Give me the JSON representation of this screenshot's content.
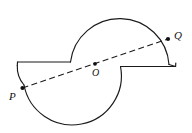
{
  "figure": {
    "type": "geometry-diagram",
    "canvas": {
      "width": 192,
      "height": 133
    },
    "stroke_color": "#1a1a1a",
    "background_color": "#ffffff",
    "points": [
      {
        "id": "P",
        "label": "P",
        "x": 22,
        "y": 88,
        "marker": "dot"
      },
      {
        "id": "O",
        "label": "O",
        "x": 95,
        "y": 64,
        "marker": "dot"
      },
      {
        "id": "Q",
        "label": "Q",
        "x": 168,
        "y": 39,
        "marker": "dot"
      }
    ],
    "segments": [
      {
        "id": "PQ",
        "name": "dashed-diagonal-PQ",
        "style": "dashed",
        "from": "P",
        "to": "Q",
        "passes_through": "O"
      }
    ],
    "paths": {
      "outline": "M 16 62 L 16 63 L 70 63 A 52 52 0 1 1 120 68 L 175 68 L 175 65 A 52 52 0 1 1 122 63 L 16 63",
      "outline_description": "Closed S-shaped outline: left horizontal edge, large upper semicircular arc, right horizontal edge, lower semicircular arc"
    },
    "labels": {
      "P": "P",
      "O": "O",
      "Q": "Q"
    }
  }
}
